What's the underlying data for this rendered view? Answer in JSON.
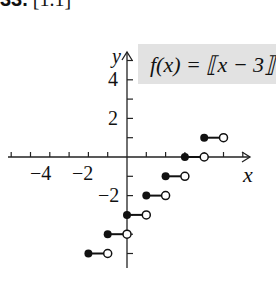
{
  "problem": {
    "number": "33.",
    "bracket": "[1.1]"
  },
  "chart_data": {
    "type": "step",
    "title": "f(x) = ⟦x − 3⟧",
    "xlabel": "x",
    "ylabel": "y",
    "xticks": [
      "−4",
      "−2"
    ],
    "yticks": [
      "4",
      "2",
      "−2"
    ],
    "segments": [
      {
        "x_start": -2,
        "x_end": -1,
        "y": -5
      },
      {
        "x_start": -1,
        "x_end": 0,
        "y": -4
      },
      {
        "x_start": 0,
        "x_end": 1,
        "y": -3
      },
      {
        "x_start": 1,
        "x_end": 2,
        "y": -2
      },
      {
        "x_start": 2,
        "x_end": 3,
        "y": -1
      },
      {
        "x_start": 3,
        "x_end": 4,
        "y": 0
      },
      {
        "x_start": 4,
        "x_end": 5,
        "y": 1
      }
    ],
    "endpoints": "closed left, open right"
  }
}
